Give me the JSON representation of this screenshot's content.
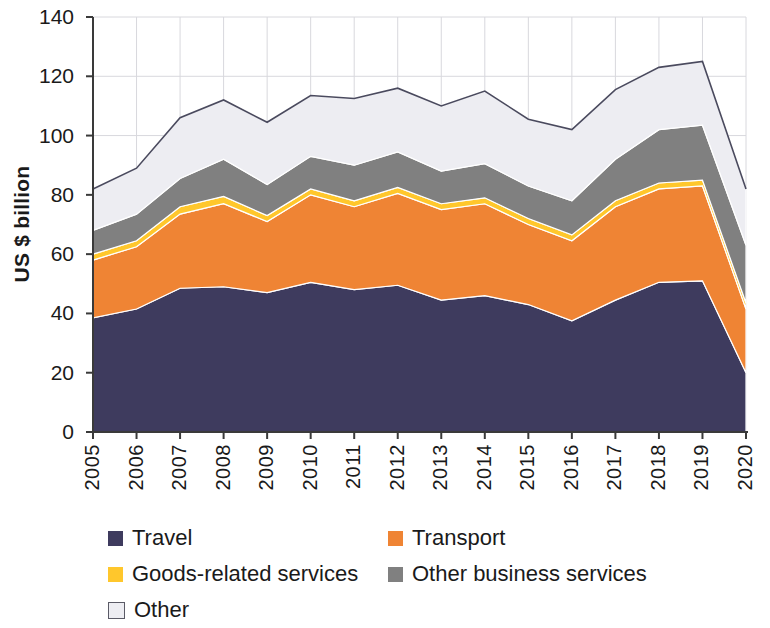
{
  "chart_data": {
    "type": "area",
    "stacked": true,
    "title": "",
    "subtitle": "",
    "xlabel": "",
    "ylabel": "US $ billion",
    "ylim": [
      0,
      140
    ],
    "ytick_step": 20,
    "yticks": [
      "0",
      "20",
      "40",
      "60",
      "80",
      "100",
      "120",
      "140"
    ],
    "grid": true,
    "grid_axis": "both",
    "legend_position": "bottom",
    "categories": [
      "2005",
      "2006",
      "2007",
      "2008",
      "2009",
      "2010",
      "2011",
      "2012",
      "2013",
      "2014",
      "2015",
      "2016",
      "2017",
      "2018",
      "2019",
      "2020"
    ],
    "x": [
      2005,
      2006,
      2007,
      2008,
      2009,
      2010,
      2011,
      2012,
      2013,
      2014,
      2015,
      2016,
      2017,
      2018,
      2019,
      2020
    ],
    "series": [
      {
        "name": "Travel",
        "color": "#3E3B5E",
        "values": [
          38.5,
          41.5,
          48.5,
          49.0,
          47.0,
          50.5,
          48.0,
          49.5,
          44.5,
          46.0,
          43.0,
          37.5,
          44.5,
          50.5,
          51.0,
          20.0
        ]
      },
      {
        "name": "Transport",
        "color": "#EF8434",
        "values": [
          19.5,
          21.0,
          25.0,
          28.0,
          24.0,
          29.5,
          28.0,
          31.0,
          30.5,
          31.0,
          27.0,
          27.0,
          31.5,
          31.5,
          32.0,
          21.5
        ]
      },
      {
        "name": "Goods-related services",
        "color": "#FFC72C",
        "values": [
          2.0,
          2.0,
          2.5,
          2.5,
          2.0,
          2.0,
          2.0,
          2.0,
          2.0,
          2.0,
          2.0,
          2.0,
          2.0,
          2.0,
          2.0,
          2.0
        ]
      },
      {
        "name": "Other business services",
        "color": "#808080",
        "values": [
          8.0,
          9.0,
          9.5,
          12.5,
          10.5,
          11.0,
          12.0,
          12.0,
          11.0,
          11.5,
          11.0,
          11.5,
          14.0,
          18.0,
          18.5,
          19.5
        ]
      },
      {
        "name": "Other",
        "color": "#EDEDF2",
        "values": [
          14.0,
          15.5,
          20.5,
          20.0,
          21.0,
          20.5,
          22.5,
          21.5,
          22.0,
          24.5,
          22.5,
          24.0,
          23.5,
          21.0,
          21.5,
          19.0
        ]
      }
    ],
    "totals": [
      82.0,
      89.0,
      106.0,
      112.0,
      104.5,
      113.5,
      112.5,
      116.0,
      110.0,
      115.0,
      105.5,
      102.0,
      115.5,
      123.0,
      125.0,
      82.0
    ],
    "annotations": []
  },
  "legend": {
    "rows": [
      [
        {
          "label": "Travel",
          "color": "#3E3B5E",
          "outlined": false
        },
        {
          "label": "Transport",
          "color": "#EF8434",
          "outlined": false
        }
      ],
      [
        {
          "label": "Goods-related services",
          "color": "#FFC72C",
          "outlined": false
        },
        {
          "label": "Other business services",
          "color": "#808080",
          "outlined": false
        }
      ],
      [
        {
          "label": "Other",
          "color": "#EDEDF2",
          "outlined": true
        }
      ]
    ]
  }
}
